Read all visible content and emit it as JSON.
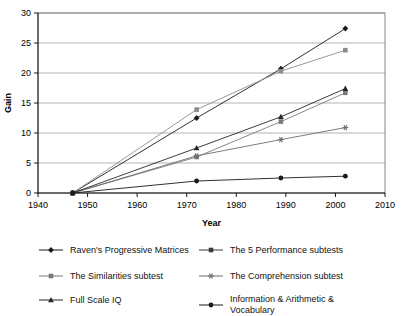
{
  "chart_data": {
    "type": "line",
    "title": "",
    "xlabel": "Year",
    "ylabel": "Gain",
    "xlim": [
      1940,
      2010
    ],
    "ylim": [
      0,
      30
    ],
    "xticks": [
      1940,
      1950,
      1960,
      1970,
      1980,
      1990,
      2000,
      2010
    ],
    "yticks": [
      0,
      5,
      10,
      15,
      20,
      25,
      30
    ],
    "grid": "horizontal",
    "legend_position": "bottom",
    "x": [
      1947,
      1972,
      1989,
      2002
    ],
    "series": [
      {
        "name": "Raven's Progressive Matrices",
        "marker": "diamond",
        "color": "#1a1a1a",
        "values": [
          0,
          12.5,
          20.7,
          27.4
        ]
      },
      {
        "name": "The 5 Performance subtests",
        "marker": "square",
        "color": "#8c8c8c",
        "values": [
          0,
          13.9,
          20.3,
          23.8
        ]
      },
      {
        "name": "The Similarities subtest",
        "marker": "square",
        "color": "#7a7a7a",
        "values": [
          0,
          6.0,
          11.9,
          16.7
        ]
      },
      {
        "name": "The Comprehension subtest",
        "marker": "asterisk",
        "color": "#6e6e6e",
        "values": [
          0,
          6.2,
          8.9,
          10.9
        ]
      },
      {
        "name": "Full Scale IQ",
        "marker": "triangle",
        "color": "#262626",
        "values": [
          0,
          7.5,
          12.7,
          17.4
        ]
      },
      {
        "name": "Information & Arithmetic &\nVocabulary",
        "marker": "circle",
        "color": "#1a1a1a",
        "values": [
          0,
          2.0,
          2.5,
          2.8
        ]
      }
    ]
  },
  "axes": {
    "x_title": "Year",
    "y_title": "Gain",
    "x_tick_labels": [
      "1940",
      "1950",
      "1960",
      "1970",
      "1980",
      "1990",
      "2000",
      "2010"
    ],
    "y_tick_labels": [
      "0",
      "5",
      "10",
      "15",
      "20",
      "25",
      "30"
    ]
  },
  "legend": {
    "entries": [
      {
        "label": "Raven's Progressive Matrices",
        "marker": "diamond",
        "color": "#1a1a1a"
      },
      {
        "label": "The 5 Performance subtests",
        "marker": "square",
        "color": "#3a3a3a"
      },
      {
        "label": "The Similarities subtest",
        "marker": "square",
        "color": "#7a7a7a"
      },
      {
        "label": "The Comprehension subtest",
        "marker": "asterisk",
        "color": "#6e6e6e"
      },
      {
        "label": "Full Scale IQ",
        "marker": "triangle",
        "color": "#262626"
      },
      {
        "label": "Information & Arithmetic &\nVocabulary",
        "marker": "circle",
        "color": "#1a1a1a"
      }
    ]
  }
}
